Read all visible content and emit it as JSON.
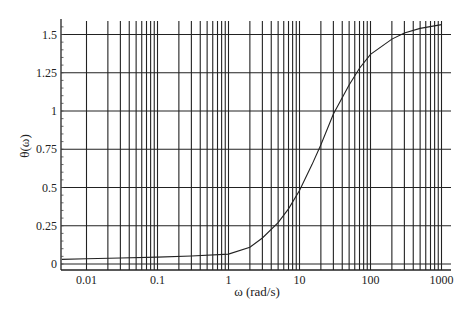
{
  "chart_data": {
    "type": "line",
    "title": "",
    "xlabel": "ω (rad/s)",
    "ylabel": "θ(ω)",
    "xscale": "log",
    "xlim": [
      0.0045,
      1000
    ],
    "ylim": [
      0,
      1.58
    ],
    "grid": true,
    "x_ticks": [
      {
        "value": 0.01,
        "label": "0.01"
      },
      {
        "value": 0.1,
        "label": "0.1"
      },
      {
        "value": 1,
        "label": "1"
      },
      {
        "value": 10,
        "label": "10"
      },
      {
        "value": 100,
        "label": "100"
      },
      {
        "value": 1000,
        "label": "1000"
      }
    ],
    "y_ticks": [
      {
        "value": 0,
        "label": "0"
      },
      {
        "value": 0.25,
        "label": "0.25"
      },
      {
        "value": 0.5,
        "label": "0.5"
      },
      {
        "value": 0.75,
        "label": "0.75"
      },
      {
        "value": 1,
        "label": "1"
      },
      {
        "value": 1.25,
        "label": "1.25"
      },
      {
        "value": 1.5,
        "label": "1.5"
      }
    ],
    "series": [
      {
        "name": "θ(ω)",
        "x": [
          0.0045,
          0.01,
          0.03,
          0.1,
          0.3,
          1,
          2,
          3,
          5,
          7,
          10,
          15,
          20,
          30,
          50,
          70,
          100,
          200,
          300,
          500,
          1000
        ],
        "y": [
          0.03,
          0.034,
          0.039,
          0.045,
          0.052,
          0.065,
          0.11,
          0.17,
          0.27,
          0.36,
          0.48,
          0.65,
          0.78,
          0.98,
          1.17,
          1.28,
          1.37,
          1.47,
          1.51,
          1.54,
          1.565
        ]
      }
    ],
    "legend": null
  }
}
